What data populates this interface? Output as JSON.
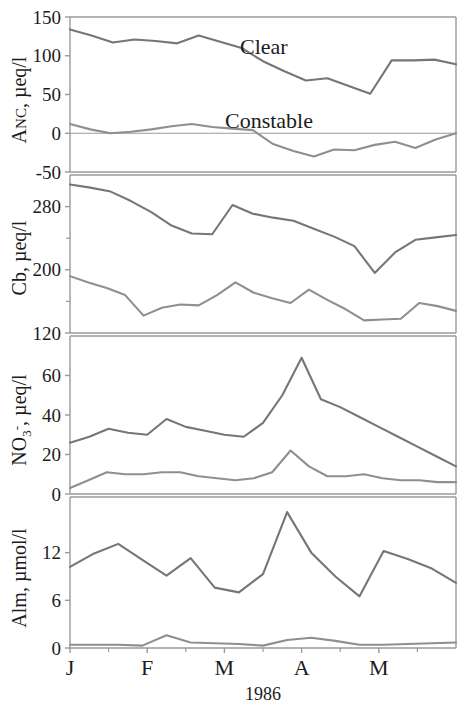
{
  "figure": {
    "title": "",
    "xlabel": "1986",
    "series_labels": {
      "clear": "Clear",
      "constable": "Constable"
    },
    "month_ticks": [
      "J",
      "F",
      "M",
      "A",
      "M"
    ],
    "colors": {
      "line": "#8f8f8f",
      "line_dark": "#767676",
      "axis": "#9a9a9a",
      "text": "#1c1c1c"
    }
  },
  "panels": {
    "anc": {
      "ylabel_main": "A",
      "ylabel_smallcap": "NC",
      "ylabel_rest": ", µeq/l",
      "ylabel_full": "Anc, µeq/l",
      "ticks": [
        "150",
        "100",
        "50",
        "0",
        "-50"
      ],
      "tick_values": [
        150,
        100,
        50,
        0,
        -50
      ],
      "ylim": [
        -50,
        150
      ]
    },
    "cb": {
      "ylabel_full": "Cb, µeq/l",
      "ticks": [
        "280",
        "200",
        "120"
      ],
      "tick_values": [
        280,
        200,
        120
      ],
      "ylim": [
        120,
        320
      ]
    },
    "no3": {
      "ylabel_main": "NO",
      "ylabel_sub": "3",
      "ylabel_sup": "-",
      "ylabel_rest": ", µeq/l",
      "ylabel_full": "NO3-, µeq/l",
      "ticks": [
        "60",
        "40",
        "20",
        "0"
      ],
      "tick_values": [
        60,
        40,
        20,
        0
      ],
      "ylim": [
        0,
        80
      ]
    },
    "alm": {
      "ylabel_full": "Alm, µmol/l",
      "ticks": [
        "12",
        "6",
        "0"
      ],
      "tick_values": [
        12,
        6,
        0
      ],
      "ylim": [
        0,
        19
      ]
    }
  },
  "chart_data": {
    "type": "line",
    "title": "",
    "xlabel": "1986",
    "x_tick_labels": [
      "J",
      "F",
      "M",
      "A",
      "M"
    ],
    "x_tick_positions": [
      0,
      4,
      8,
      12,
      16
    ],
    "x": [
      0,
      1,
      2,
      3,
      4,
      5,
      6,
      7,
      8,
      9,
      10,
      11,
      12,
      13,
      14,
      15,
      16,
      17,
      18
    ],
    "grid": false,
    "legend": "inline-annotations",
    "panels": [
      {
        "key": "anc",
        "ylabel": "Anc, µeq/l",
        "ylim": [
          -50,
          150
        ],
        "yticks": [
          -50,
          0,
          50,
          100,
          150
        ],
        "series": [
          {
            "name": "Clear",
            "values": [
              134,
              126,
              117,
              121,
              119,
              116,
              126,
              118,
              110,
              93,
              80,
              68,
              71,
              61,
              51,
              94,
              94,
              95,
              89
            ]
          },
          {
            "name": "Constable",
            "values": [
              12,
              5,
              0,
              2,
              5,
              9,
              12,
              8,
              6,
              4,
              -14,
              -23,
              -30,
              -21,
              -22,
              -15,
              -11,
              -19,
              -8,
              0
            ]
          }
        ]
      },
      {
        "key": "cb",
        "ylabel": "Cb, µeq/l",
        "ylim": [
          120,
          320
        ],
        "yticks": [
          120,
          200,
          280
        ],
        "series": [
          {
            "name": "Clear",
            "values": [
              308,
              304,
              299,
              287,
              273,
              256,
              246,
              245,
              282,
              271,
              266,
              262,
              252,
              242,
              230,
              196,
              222,
              238,
              241,
              244
            ]
          },
          {
            "name": "Constable",
            "values": [
              192,
              184,
              177,
              168,
              142,
              152,
              156,
              155,
              168,
              184,
              171,
              164,
              158,
              175,
              162,
              150,
              136,
              137,
              138,
              158,
              154,
              148
            ]
          }
        ]
      },
      {
        "key": "no3",
        "ylabel": "NO3-, µeq/l",
        "ylim": [
          0,
          80
        ],
        "yticks": [
          0,
          20,
          40,
          60
        ],
        "series": [
          {
            "name": "Clear",
            "values": [
              26,
              29,
              33,
              31,
              30,
              38,
              34,
              32,
              30,
              29,
              36,
              50,
              69,
              48,
              44,
              39,
              34,
              29,
              24,
              19,
              14
            ]
          },
          {
            "name": "Constable",
            "values": [
              3,
              7,
              11,
              10,
              10,
              11,
              11,
              9,
              8,
              7,
              8,
              11,
              22,
              14,
              9,
              9,
              10,
              8,
              7,
              7,
              6,
              6
            ]
          }
        ]
      },
      {
        "key": "alm",
        "ylabel": "Alm, µmol/l",
        "ylim": [
          0,
          19
        ],
        "yticks": [
          0,
          6,
          12
        ],
        "series": [
          {
            "name": "Clear",
            "values": [
              10.2,
              11.9,
              13.1,
              11.1,
              9.1,
              11.3,
              7.6,
              7.0,
              9.3,
              17.1,
              12.0,
              9.0,
              6.5,
              12.2,
              11.2,
              10.0,
              8.2
            ]
          },
          {
            "name": "Constable",
            "values": [
              0.4,
              0.4,
              0.4,
              0.3,
              1.6,
              0.7,
              0.6,
              0.5,
              0.3,
              1.0,
              1.3,
              0.9,
              0.4,
              0.4,
              0.5,
              0.6,
              0.7
            ]
          }
        ]
      }
    ]
  }
}
